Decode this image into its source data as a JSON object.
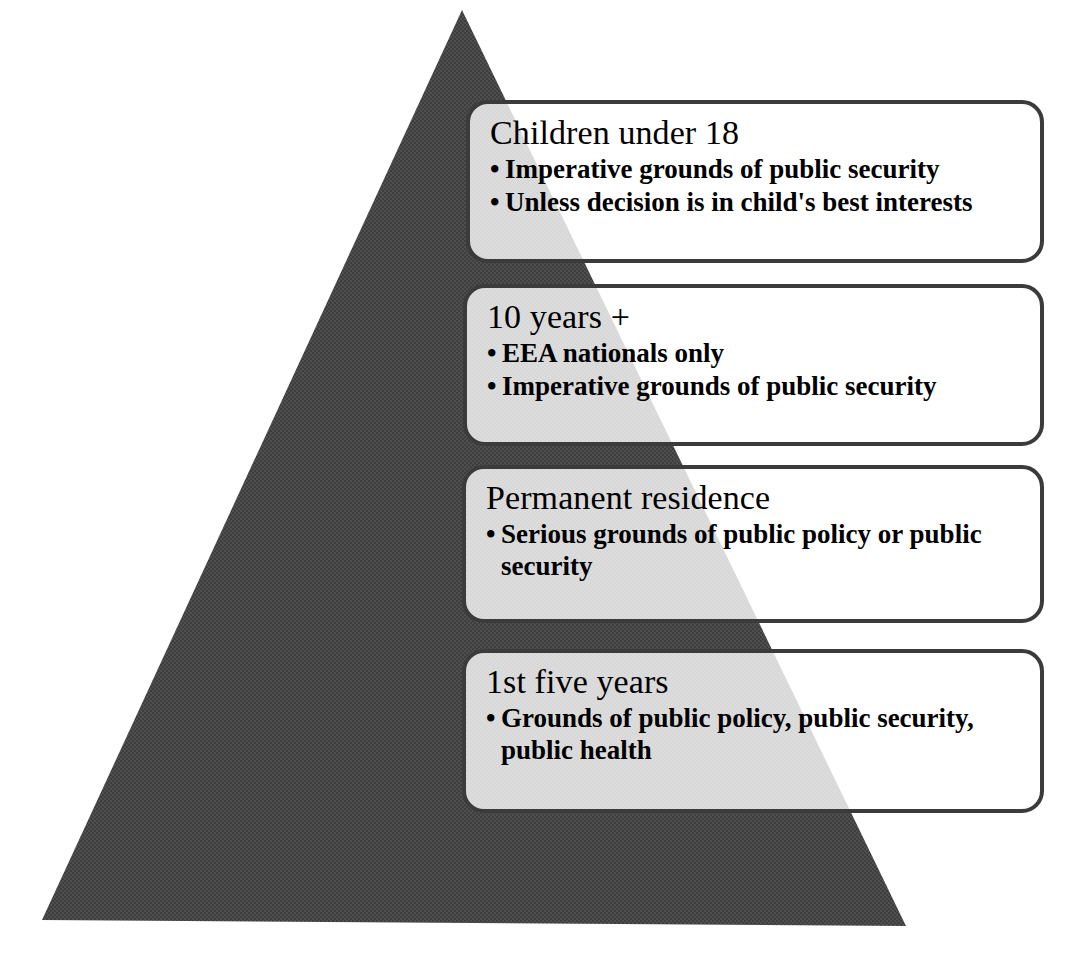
{
  "diagram": {
    "type": "pyramid",
    "background_color": "#ffffff",
    "pyramid": {
      "name": "protection-pyramid",
      "fill_color": "#4a4a4a",
      "texture": "halftone-checker",
      "apex": {
        "x": 462,
        "y": 10
      },
      "base_left": {
        "x": 42,
        "y": 920
      },
      "base_right": {
        "x": 906,
        "y": 926
      }
    },
    "tiers": [
      {
        "id": "children-under-18",
        "title": "Children under 18",
        "bullets": [
          "Imperative grounds of public security",
          "Unless decision is in child's best interests"
        ]
      },
      {
        "id": "ten-years-plus",
        "title": "10 years +",
        "bullets": [
          "EEA nationals only",
          "Imperative grounds of public security"
        ]
      },
      {
        "id": "permanent-residence",
        "title": "Permanent residence",
        "bullets": [
          "Serious grounds of public policy or public security"
        ]
      },
      {
        "id": "first-five-years",
        "title": "1st five years",
        "bullets": [
          "Grounds of public policy, public security, public health"
        ]
      }
    ]
  }
}
